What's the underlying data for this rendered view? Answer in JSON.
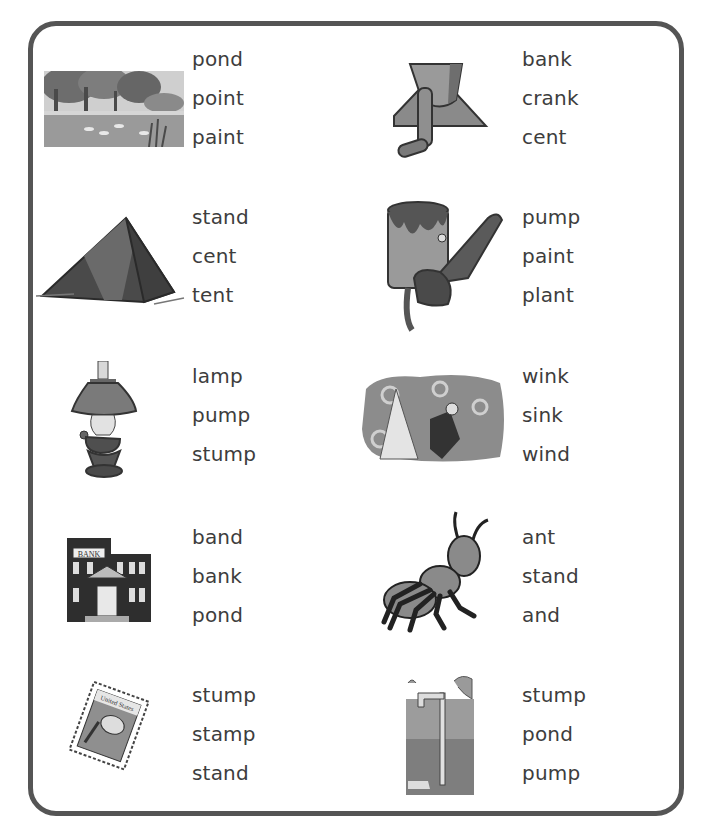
{
  "worksheet": {
    "instructions_visible": false,
    "items": [
      {
        "picture": "pond",
        "choices": [
          "pond",
          "point",
          "paint"
        ]
      },
      {
        "picture": "crank",
        "choices": [
          "bank",
          "crank",
          "cent"
        ]
      },
      {
        "picture": "tent",
        "choices": [
          "stand",
          "cent",
          "tent"
        ]
      },
      {
        "picture": "paint",
        "choices": [
          "pump",
          "paint",
          "plant"
        ]
      },
      {
        "picture": "lamp",
        "choices": [
          "lamp",
          "pump",
          "stump"
        ]
      },
      {
        "picture": "wind",
        "choices": [
          "wink",
          "sink",
          "wind"
        ]
      },
      {
        "picture": "bank",
        "choices": [
          "band",
          "bank",
          "pond"
        ],
        "picture_label": "BANK"
      },
      {
        "picture": "ant",
        "choices": [
          "ant",
          "stand",
          "and"
        ]
      },
      {
        "picture": "stamp",
        "choices": [
          "stump",
          "stamp",
          "stand"
        ],
        "picture_label": "United States"
      },
      {
        "picture": "pump",
        "choices": [
          "stump",
          "pond",
          "pump"
        ]
      }
    ]
  },
  "colors": {
    "border": "#555555",
    "text": "#3d3d3d",
    "art_dark": "#3c3c3c",
    "art_mid": "#7a7a7a",
    "art_light": "#a8a8a8"
  }
}
